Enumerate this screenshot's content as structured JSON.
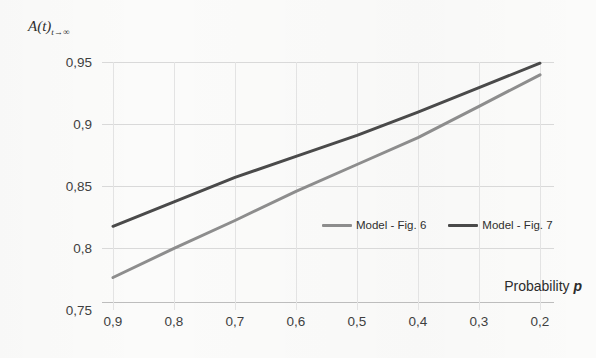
{
  "chart_data": {
    "type": "line",
    "title": "",
    "ylabel": "A(t)",
    "ylabel_sub": "t→∞",
    "xlabel": "Probability",
    "xlabel_var": "p",
    "x": [
      0.9,
      0.8,
      0.7,
      0.6,
      0.5,
      0.4,
      0.3,
      0.2
    ],
    "xticklabels": [
      "0,9",
      "0,8",
      "0,7",
      "0,6",
      "0,5",
      "0,4",
      "0,3",
      "0,2"
    ],
    "xlim": [
      0.9,
      0.2
    ],
    "x_inverted": true,
    "yticklabels": [
      "0,75",
      "0,8",
      "0,85",
      "0,9",
      "0,95"
    ],
    "yticks": [
      0.75,
      0.8,
      0.85,
      0.9,
      0.95
    ],
    "ylim": [
      0.75,
      0.95
    ],
    "grid": true,
    "grid_axis": "both",
    "legend_position": "inside-right-lower",
    "series": [
      {
        "name": "Model - Fig. 6",
        "color": "#8d8d8d",
        "values": [
          0.771,
          0.796,
          0.82,
          0.845,
          0.868,
          0.891,
          0.918,
          0.945
        ]
      },
      {
        "name": "Model - Fig. 7",
        "color": "#4a4a4a",
        "values": [
          0.815,
          0.836,
          0.857,
          0.875,
          0.893,
          0.913,
          0.934,
          0.955
        ]
      }
    ]
  },
  "legend": {
    "items": [
      {
        "label": "Model - Fig. 6",
        "color": "#8d8d8d"
      },
      {
        "label": "Model - Fig. 7",
        "color": "#4a4a4a"
      }
    ]
  },
  "colors": {
    "background": "#fbfbfa",
    "gridline": "#d9d9d9",
    "axis": "#bdbdbd",
    "text": "#3c3c3c",
    "series_light": "#8d8d8d",
    "series_dark": "#4a4a4a"
  }
}
